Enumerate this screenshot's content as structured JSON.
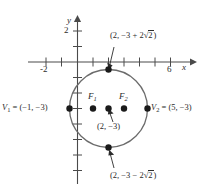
{
  "figure": {
    "kind": "coordinate-plane-circle-diagram",
    "axes": {
      "x_label": "x",
      "y_label": "y",
      "x_ticks_labeled": [
        {
          "value": -2,
          "text": "-2"
        },
        {
          "value": 6,
          "text": "6"
        }
      ],
      "y_ticks_labeled": [
        {
          "value": 2,
          "text": "2"
        }
      ]
    },
    "curve": {
      "type": "circle",
      "center": [
        2,
        -3
      ],
      "radius": 3
    },
    "points": [
      {
        "name": "top-point",
        "label": "(2, −3 + 2√2 )",
        "x": 2,
        "y": -0.172
      },
      {
        "name": "bottom-point",
        "label": "(2, −3 − 2√2 )",
        "x": 2,
        "y": -5.828
      },
      {
        "name": "center-point",
        "label": "(2, −3)",
        "x": 2,
        "y": -3
      },
      {
        "name": "focus-1",
        "label": "F",
        "sub": "1",
        "x": 1,
        "y": -3
      },
      {
        "name": "focus-2",
        "label": "F",
        "sub": "2",
        "x": 3,
        "y": -3
      },
      {
        "name": "vertex-1",
        "label": "V",
        "sub": "1",
        "equals": " = (−1, −3)",
        "x": -1,
        "y": -3
      },
      {
        "name": "vertex-2",
        "label": "V",
        "sub": "2",
        "equals": " = (5, −3)",
        "x": 5,
        "y": -3
      }
    ],
    "text": {
      "top_label_prefix": "(2, −3 + 2",
      "top_label_suffix": ")",
      "bottom_label_prefix": "(2, −3 − 2",
      "bottom_label_suffix": ")",
      "radical_sign": "√",
      "radicand": "2",
      "center_label": "(2, −3)",
      "focus1_letter": "F",
      "focus1_sub": "1",
      "focus2_letter": "F",
      "focus2_sub": "2",
      "vertex1_letter": "V",
      "vertex1_sub": "1",
      "vertex1_value": " = (−1, −3)",
      "vertex2_letter": "V",
      "vertex2_sub": "2",
      "vertex2_value": " = (5, −3)",
      "x_axis_name": "x",
      "y_axis_name": "y",
      "xtick_neg2": "-2",
      "xtick_6": "6",
      "ytick_2": "2"
    },
    "colors": {
      "axis": "#4a4a4a",
      "curve": "#6b6b6b",
      "dot": "#1a1a1a",
      "text": "#2b2b2b",
      "background": "#ffffff"
    }
  }
}
